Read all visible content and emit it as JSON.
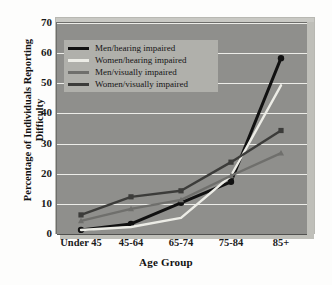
{
  "chart_data": {
    "type": "line",
    "title": "",
    "xlabel": "Age Group",
    "ylabel": "Percentage of Individuals Reporting Difficulty",
    "ylabel_line1": "Percentage of Individuals Reporting",
    "ylabel_line2": "Difficulty",
    "categories": [
      "Under 45",
      "45-64",
      "65-74",
      "75-84",
      "85+"
    ],
    "ylim": [
      0,
      70
    ],
    "ytick_step": 10,
    "yticks": [
      0,
      10,
      20,
      30,
      40,
      50,
      60,
      70
    ],
    "grid": true,
    "legend_position": "top-left-inside",
    "series": [
      {
        "name": "Men/hearing impaired",
        "color": "#111111",
        "marker": "circle",
        "values": [
          1,
          3,
          10,
          17,
          58
        ]
      },
      {
        "name": "Women/hearing impaired",
        "color": "#ecece6",
        "marker": "none",
        "values": [
          1,
          2,
          5,
          19,
          49
        ]
      },
      {
        "name": "Men/visually impaired",
        "color": "#6f6f6c",
        "marker": "triangle",
        "values": [
          4,
          8,
          11,
          19,
          26.5
        ]
      },
      {
        "name": "Women/visually impaired",
        "color": "#3c3c3a",
        "marker": "square",
        "values": [
          6,
          12,
          14,
          23.5,
          34
        ]
      }
    ]
  },
  "colors": {
    "panel_background": "#8f8f8c",
    "gridline": "#f2f2ee",
    "legend_background": "#b0b0ab",
    "figure_background": "#fdfdfc",
    "axis_text": "#1a1a1a"
  }
}
